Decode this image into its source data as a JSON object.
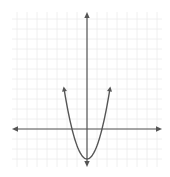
{
  "chart_data": {
    "type": "line",
    "title": "",
    "xlabel": "",
    "ylabel": "",
    "grid": true,
    "legend": null,
    "xlim": [
      -7.5,
      7.5
    ],
    "ylim": [
      -3.8,
      11.7
    ],
    "series": [
      {
        "name": "parabola",
        "equation": "y = (4/3)x^2 - 3",
        "x": [
          -2.3,
          -2.0,
          -1.5,
          -1.0,
          -0.5,
          0,
          0.5,
          1.0,
          1.5,
          2.0,
          2.3
        ],
        "y": [
          4.05,
          2.33,
          0,
          -1.67,
          -2.67,
          -3,
          -2.67,
          -1.67,
          0,
          2.33,
          4.05
        ],
        "vertex": [
          0,
          -3
        ],
        "x_intercepts": [
          -1.5,
          1.5
        ],
        "end_arrows": true
      }
    ]
  },
  "style": {
    "axis_color": "#555555",
    "curve_color": "#555555",
    "grid_color": "#ececec",
    "background": "#ffffff"
  }
}
